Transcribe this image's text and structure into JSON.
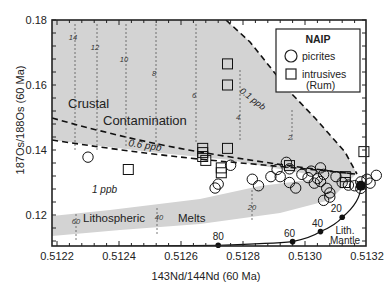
{
  "chart_data": {
    "type": "scatter",
    "title": "",
    "xlabel": "143Nd/144Nd (60 Ma)",
    "ylabel": "187Os/188Os (60 Ma)",
    "xlim": [
      0.51218,
      0.5132
    ],
    "ylim": [
      0.111,
      0.18
    ],
    "x_ticks": [
      "0.5122",
      "0.5124",
      "0.5126",
      "0.5128",
      "0.5130",
      "0.5132"
    ],
    "y_ticks": [
      "0.12",
      "0.14",
      "0.16",
      "0.18"
    ],
    "grid": false,
    "legend": {
      "position": "upper right",
      "title": "NAIP",
      "entries": [
        {
          "marker": "circle",
          "label": "picrites"
        },
        {
          "marker": "square",
          "label": "intrusives",
          "sublabel": "(Rum)"
        }
      ]
    },
    "regions": [
      {
        "label_line1": "Crustal",
        "label_line2": "Contamination"
      },
      {
        "label_line1": "Lithospheric",
        "label_line2": "Melts"
      }
    ],
    "curves": [
      {
        "name": "0.1 ppb",
        "style": "dashed"
      },
      {
        "name": "0.6 ppb",
        "style": "dashed"
      },
      {
        "name": "1 ppb",
        "style": "dashed"
      }
    ],
    "crustal_tick_labels": [
      "14",
      "12",
      "10",
      "8",
      "6",
      "4",
      "2"
    ],
    "lithospheric_tick_labels": [
      "60",
      "40",
      "20"
    ],
    "mantle_curve": {
      "label_line1": "Lith.",
      "label_line2": "Mantle",
      "points": [
        {
          "label": "80",
          "x": 0.51272,
          "y": 0.1107
        },
        {
          "label": "60",
          "x": 0.51296,
          "y": 0.1118
        },
        {
          "label": "40",
          "x": 0.51305,
          "y": 0.1149
        },
        {
          "label": "20",
          "x": 0.51312,
          "y": 0.1193
        },
        {
          "label": "",
          "x": 0.51318,
          "y": 0.129
        }
      ]
    },
    "series": [
      {
        "name": "picrites",
        "marker": "circle",
        "points": [
          [
            0.5123,
            0.1378
          ],
          [
            0.51276,
            0.1353
          ],
          [
            0.51272,
            0.1295
          ],
          [
            0.51271,
            0.1283
          ],
          [
            0.51283,
            0.131
          ],
          [
            0.51285,
            0.129
          ],
          [
            0.51291,
            0.134
          ],
          [
            0.51289,
            0.1318
          ],
          [
            0.51294,
            0.1362
          ],
          [
            0.51295,
            0.1342
          ],
          [
            0.51292,
            0.1318
          ],
          [
            0.51295,
            0.13
          ],
          [
            0.51297,
            0.1283
          ],
          [
            0.51299,
            0.1325
          ],
          [
            0.51302,
            0.1335
          ],
          [
            0.51301,
            0.1315
          ],
          [
            0.51303,
            0.1298
          ],
          [
            0.51305,
            0.1345
          ],
          [
            0.51306,
            0.1325
          ],
          [
            0.51305,
            0.1303
          ],
          [
            0.51307,
            0.1282
          ],
          [
            0.51308,
            0.1268
          ],
          [
            0.51308,
            0.1255
          ],
          [
            0.51306,
            0.1245
          ],
          [
            0.51304,
            0.1312
          ],
          [
            0.5131,
            0.1318
          ],
          [
            0.51312,
            0.13
          ],
          [
            0.51314,
            0.1292
          ],
          [
            0.51316,
            0.129
          ],
          [
            0.51318,
            0.1302
          ],
          [
            0.5132,
            0.131
          ],
          [
            0.51321,
            0.1298
          ],
          [
            0.51323,
            0.1322
          ],
          [
            0.51318,
            0.1282
          ]
        ]
      },
      {
        "name": "intrusives (Rum)",
        "marker": "square",
        "points": [
          [
            0.51243,
            0.134
          ],
          [
            0.51267,
            0.1405
          ],
          [
            0.51267,
            0.1392
          ],
          [
            0.51267,
            0.138
          ],
          [
            0.51268,
            0.1368
          ],
          [
            0.51275,
            0.1405
          ],
          [
            0.51275,
            0.16
          ],
          [
            0.51275,
            0.1665
          ],
          [
            0.51273,
            0.1345
          ],
          [
            0.51273,
            0.133
          ],
          [
            0.51295,
            0.1352
          ],
          [
            0.51313,
            0.1318
          ],
          [
            0.51313,
            0.13
          ],
          [
            0.51319,
            0.1395
          ]
        ]
      }
    ]
  }
}
